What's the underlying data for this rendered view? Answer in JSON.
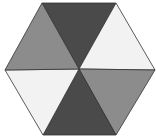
{
  "diagram": {
    "shape": "hexagon",
    "center": [
      79,
      69
    ],
    "vertices": [
      [
        42,
        3
      ],
      [
        116,
        3
      ],
      [
        155,
        70
      ],
      [
        116,
        135
      ],
      [
        43,
        135
      ],
      [
        5,
        70
      ]
    ],
    "segments": [
      {
        "name": "top",
        "fill": "#4a4a4a"
      },
      {
        "name": "upper-right",
        "fill": "#f2f2f2"
      },
      {
        "name": "lower-right",
        "fill": "#8c8c8c"
      },
      {
        "name": "bottom",
        "fill": "#4a4a4a"
      },
      {
        "name": "lower-left",
        "fill": "#f2f2f2"
      },
      {
        "name": "upper-left",
        "fill": "#8c8c8c"
      }
    ],
    "stroke": "#333333"
  }
}
